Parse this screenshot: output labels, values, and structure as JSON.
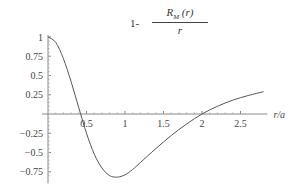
{
  "chart_data": {
    "type": "line",
    "title_parts": {
      "prefix": "1-",
      "numerator": "R",
      "numerator_sub": "M",
      "numerator_arg": "(r)",
      "denominator": "r"
    },
    "xlabel": "r/a",
    "ylabel": "",
    "xlim": [
      0,
      2.85
    ],
    "ylim": [
      -0.85,
      1.0
    ],
    "x_ticks": [
      "0.5",
      "1",
      "1.5",
      "2",
      "2.5"
    ],
    "y_ticks": [
      "1",
      "0.75",
      "0.5",
      "0.25",
      "-0.25",
      "-0.5",
      "-0.75"
    ],
    "grid": false,
    "series": [
      {
        "name": "1 - R_M(r)/r",
        "x": [
          0,
          0.1,
          0.2,
          0.3,
          0.4,
          0.5,
          0.6,
          0.7,
          0.8,
          0.9,
          1.0,
          1.1,
          1.2,
          1.4,
          1.6,
          1.8,
          2.0,
          2.2,
          2.4,
          2.6,
          2.8
        ],
        "values": [
          1.0,
          0.93,
          0.72,
          0.42,
          0.08,
          -0.25,
          -0.52,
          -0.7,
          -0.8,
          -0.82,
          -0.79,
          -0.72,
          -0.63,
          -0.45,
          -0.28,
          -0.13,
          0.0,
          0.1,
          0.18,
          0.24,
          0.29
        ]
      }
    ]
  }
}
